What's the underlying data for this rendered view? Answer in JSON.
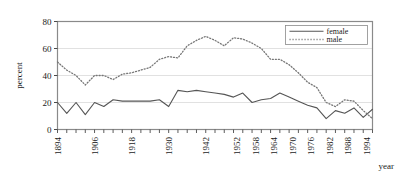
{
  "chart_data": {
    "type": "line",
    "title": "",
    "xlabel": "year",
    "ylabel": "percent",
    "xlim": [
      1894,
      1996
    ],
    "ylim": [
      0,
      80
    ],
    "yticks": [
      0,
      20,
      40,
      60,
      80
    ],
    "ytick_labels": [
      "0",
      "20",
      "40",
      "60",
      "80"
    ],
    "xticks": [
      1894,
      1906,
      1918,
      1930,
      1942,
      1952,
      1958,
      1964,
      1970,
      1976,
      1982,
      1988,
      1994
    ],
    "xtick_labels": [
      "1894",
      "1906",
      "1918",
      "1930",
      "1942",
      "1952",
      "1958",
      "1964",
      "1970",
      "1976",
      "1982",
      "1988",
      "1994"
    ],
    "grid": true,
    "grid_axis": "y",
    "grid_color": "#d9d9d9",
    "frame_color": "#8a8a8a",
    "legend_position": "top-right",
    "legend": [
      "female",
      "male"
    ],
    "series": [
      {
        "name": "female",
        "style": "solid",
        "color": "#555555",
        "x": [
          1894,
          1897,
          1900,
          1903,
          1906,
          1909,
          1912,
          1915,
          1918,
          1921,
          1924,
          1927,
          1930,
          1933,
          1936,
          1939,
          1942,
          1945,
          1948,
          1951,
          1954,
          1957,
          1960,
          1963,
          1966,
          1969,
          1972,
          1975,
          1978,
          1981,
          1984,
          1987,
          1990,
          1993,
          1996
        ],
        "values": [
          20,
          12,
          20,
          11,
          20,
          17,
          22,
          21,
          21,
          21,
          21,
          22,
          17,
          29,
          28,
          29,
          28,
          27,
          26,
          24,
          27,
          20,
          22,
          23,
          27,
          24,
          21,
          18,
          16,
          8,
          14,
          12,
          16,
          9,
          15
        ]
      },
      {
        "name": "male",
        "style": "dotted",
        "color": "#777777",
        "x": [
          1894,
          1897,
          1900,
          1903,
          1906,
          1909,
          1912,
          1915,
          1918,
          1921,
          1924,
          1927,
          1930,
          1933,
          1936,
          1939,
          1942,
          1945,
          1948,
          1951,
          1954,
          1957,
          1960,
          1963,
          1966,
          1969,
          1972,
          1975,
          1978,
          1981,
          1984,
          1987,
          1990,
          1993,
          1996
        ],
        "values": [
          50,
          44,
          40,
          33,
          40,
          40,
          37,
          41,
          42,
          44,
          46,
          52,
          54,
          53,
          62,
          66,
          69,
          66,
          62,
          68,
          67,
          64,
          60,
          52,
          52,
          48,
          42,
          35,
          31,
          20,
          17,
          22,
          21,
          14,
          8
        ]
      }
    ]
  },
  "axes": {
    "y_label": "percent",
    "x_label": "year"
  },
  "legend": {
    "items": [
      {
        "label": "female",
        "style": "solid"
      },
      {
        "label": "male",
        "style": "dotted"
      }
    ]
  }
}
